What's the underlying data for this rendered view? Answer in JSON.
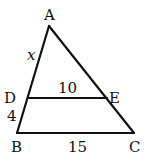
{
  "diagram": {
    "type": "triangle-with-parallel-segment",
    "points": {
      "A": {
        "label": "A",
        "x": 49,
        "y": 26
      },
      "B": {
        "label": "B",
        "x": 17,
        "y": 133
      },
      "C": {
        "label": "C",
        "x": 134,
        "y": 133
      },
      "D": {
        "label": "D",
        "x": 28,
        "y": 98
      },
      "E": {
        "label": "E",
        "x": 107,
        "y": 98
      }
    },
    "segments": [
      {
        "from": "A",
        "to": "B"
      },
      {
        "from": "A",
        "to": "C"
      },
      {
        "from": "B",
        "to": "C"
      },
      {
        "from": "D",
        "to": "E"
      }
    ],
    "measures": {
      "AD": "x",
      "DE": "10",
      "DB": "4",
      "BC": "15"
    },
    "colors": {
      "stroke": "#111111",
      "background": "#ffffff"
    }
  }
}
